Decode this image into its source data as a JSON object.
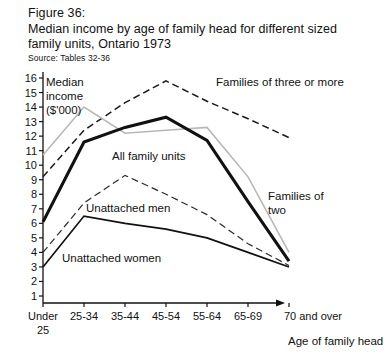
{
  "figure": {
    "number": "Figure 36:",
    "title_line1": "Median income by age of family head for different sized",
    "title_line2": "family units, Ontario 1973",
    "source": "Source: Tables 32-36"
  },
  "chart_data": {
    "type": "line",
    "title": "Median income by age of family head for different sized family units, Ontario 1973",
    "xlabel": "Age of family head",
    "ylabel": "Median income ($'000)",
    "ylabel_line1": "Median",
    "ylabel_line2": "income",
    "ylabel_line3": "($'000)",
    "categories": [
      "Under 25",
      "25-34",
      "35-44",
      "45-54",
      "55-64",
      "65-69",
      "70 and over"
    ],
    "x_tick_labels": [
      "Under",
      "25-34",
      "35-44",
      "45-54",
      "55-64",
      "65-69",
      "70 and over"
    ],
    "x_tick_label_second_line": "25",
    "ylim": [
      0,
      16
    ],
    "y_ticks": [
      16,
      15,
      14,
      13,
      12,
      11,
      10,
      9,
      8,
      7,
      6,
      5,
      4,
      3,
      2,
      1
    ],
    "grid": false,
    "legend_position": "inline-annotations",
    "series": [
      {
        "name": "Families of three or more",
        "style": "dashed",
        "color": "#1a1a1a",
        "width": 1.5,
        "values": [
          9.2,
          12.4,
          14.3,
          15.8,
          14.4,
          13.2,
          11.9
        ],
        "label_x": 216,
        "label_y": 86
      },
      {
        "name": "Families of two",
        "style": "solid-light",
        "color": "#b8b8b8",
        "width": 1.6,
        "values": [
          10.7,
          14.0,
          12.2,
          12.4,
          12.6,
          9.2,
          4.0
        ],
        "label_x": 268,
        "label_y": 200,
        "label_line2": "two",
        "label2_x": 268,
        "label2_y": 214
      },
      {
        "name": "All family units",
        "style": "solid-heavy",
        "color": "#111111",
        "width": 3.1,
        "values": [
          6.1,
          11.6,
          12.6,
          13.3,
          11.7,
          7.5,
          3.4
        ],
        "label_x": 112,
        "label_y": 160
      },
      {
        "name": "Unattached men",
        "style": "dashed",
        "color": "#2a2a2a",
        "width": 1.2,
        "values": [
          4.0,
          7.4,
          9.3,
          8.0,
          6.6,
          4.6,
          3.1
        ],
        "label_x": 86,
        "label_y": 212
      },
      {
        "name": "Unattached women",
        "style": "solid-thin",
        "color": "#111111",
        "width": 1.7,
        "values": [
          3.0,
          6.5,
          6.0,
          5.6,
          5.0,
          4.0,
          3.0
        ],
        "label_x": 62,
        "label_y": 262
      }
    ]
  },
  "axis": {
    "y_axis_name": "y-axis",
    "x_axis_name": "x-axis",
    "x_axis_caption": "Age of family head"
  }
}
